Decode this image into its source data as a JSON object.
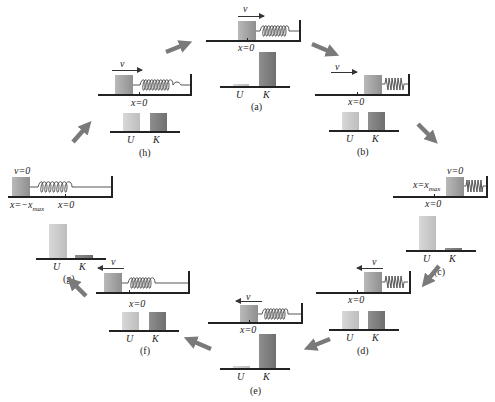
{
  "figure": {
    "colors": {
      "block": "#9a9a9a",
      "potential_bar": "#cccccc",
      "kinetic_bar": "#7d7d7d",
      "arrow": "#7a7a7a",
      "line": "#222222"
    },
    "bar_labels": {
      "U": "U",
      "K": "K"
    },
    "panels": [
      {
        "id": "a",
        "caption": "(a)",
        "velocity_label": "v",
        "velocity_dir": "right",
        "position_label": "x=0",
        "extra_label": "",
        "U": 3,
        "K": 35
      },
      {
        "id": "b",
        "caption": "(b)",
        "velocity_label": "v",
        "velocity_dir": "right",
        "position_label": "x=0",
        "extra_label": "",
        "U": 18,
        "K": 18
      },
      {
        "id": "c",
        "caption": "(c)",
        "velocity_label": "v=0",
        "velocity_dir": "none",
        "position_label": "x=0",
        "extra_label": "x=x_max",
        "U": 35,
        "K": 3
      },
      {
        "id": "d",
        "caption": "(d)",
        "velocity_label": "v",
        "velocity_dir": "left",
        "position_label": "x=0",
        "extra_label": "",
        "U": 18,
        "K": 18
      },
      {
        "id": "e",
        "caption": "(e)",
        "velocity_label": "v",
        "velocity_dir": "left",
        "position_label": "x=0",
        "extra_label": "",
        "U": 3,
        "K": 35
      },
      {
        "id": "f",
        "caption": "(f)",
        "velocity_label": "v",
        "velocity_dir": "left",
        "position_label": "x=0",
        "extra_label": "",
        "U": 18,
        "K": 18
      },
      {
        "id": "g",
        "caption": "(g)",
        "velocity_label": "v=0",
        "velocity_dir": "none",
        "position_label": "x=0",
        "extra_label": "x=−x_max",
        "U": 35,
        "K": 3
      },
      {
        "id": "h",
        "caption": "(h)",
        "velocity_label": "v",
        "velocity_dir": "right",
        "position_label": "x=0",
        "extra_label": "",
        "U": 18,
        "K": 18
      }
    ]
  }
}
